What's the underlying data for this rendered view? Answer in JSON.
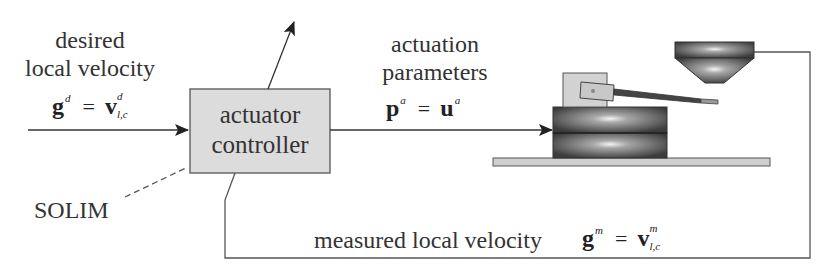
{
  "diagram": {
    "type": "control-loop block diagram",
    "input": {
      "label_line1": "desired",
      "label_line2": "local velocity",
      "equation": {
        "lhs": "g",
        "lhs_sup": "d",
        "eq": "=",
        "rhs": "v",
        "rhs_sup": "d",
        "rhs_sub": "l,c"
      }
    },
    "controller": {
      "line1": "actuator",
      "line2": "controller",
      "fill": "#dcdcdc"
    },
    "solim_label": "SOLIM",
    "output": {
      "label_line1": "actuation",
      "label_line2": "parameters",
      "equation": {
        "lhs": "p",
        "lhs_sup": "a",
        "eq": "=",
        "rhs": "u",
        "rhs_sup": "a"
      }
    },
    "feedback": {
      "label": "measured local velocity",
      "equation": {
        "lhs": "g",
        "lhs_sup": "m",
        "eq": "=",
        "rhs": "v",
        "rhs_sup": "m",
        "rhs_sub": "l,c"
      }
    },
    "colors": {
      "line": "#333333",
      "box_fill": "#dcdcdc",
      "metal_dark": "#3a3a3a",
      "metal_light": "#d8d8d8"
    }
  }
}
